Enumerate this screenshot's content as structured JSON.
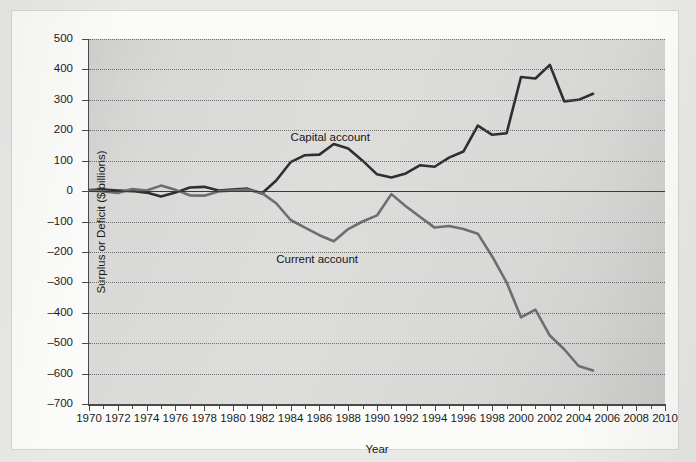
{
  "figure": {
    "background_color": "#e9e9e8",
    "plot_background_color": "#d8d8d6",
    "page_color": "#fbfbfa"
  },
  "chart_data": {
    "type": "line",
    "title": "",
    "xlabel": "Year",
    "ylabel": "Surplus or Deficit ($ billions)",
    "xlim": [
      1970,
      2010
    ],
    "ylim": [
      -700,
      500
    ],
    "ytick_step": 100,
    "xtick_step": 2,
    "x_minor_tick_step": 1,
    "grid": "horizontal dotted gridlines at every 100; solid line at 0",
    "legend": "inline labels placed next to each series",
    "yticks": [
      500,
      400,
      300,
      200,
      100,
      0,
      -100,
      -200,
      -300,
      -400,
      -500,
      -600,
      -700
    ],
    "ytick_labels": [
      "500",
      "400",
      "300",
      "200",
      "100",
      "0",
      "-100",
      "-200",
      "-300",
      "-400",
      "-500",
      "-600",
      "-700"
    ],
    "xticks": [
      1970,
      1972,
      1974,
      1976,
      1978,
      1980,
      1982,
      1984,
      1986,
      1988,
      1990,
      1992,
      1994,
      1996,
      1998,
      2000,
      2002,
      2004,
      2006,
      2008,
      2010
    ],
    "xtick_labels": [
      "1970",
      "1972",
      "1974",
      "1976",
      "1978",
      "1980",
      "1982",
      "1984",
      "1986",
      "1988",
      "1990",
      "1992",
      "1994",
      "1996",
      "1998",
      "2000",
      "2002",
      "2004",
      "2006",
      "2008",
      "2010"
    ],
    "x": [
      1970,
      1971,
      1972,
      1973,
      1974,
      1975,
      1976,
      1977,
      1978,
      1979,
      1980,
      1981,
      1982,
      1983,
      1984,
      1985,
      1986,
      1987,
      1988,
      1989,
      1990,
      1991,
      1992,
      1993,
      1994,
      1995,
      1996,
      1997,
      1998,
      1999,
      2000,
      2001,
      2002,
      2003,
      2004,
      2005
    ],
    "series": [
      {
        "name": "Capital account",
        "color": "#2f2f2f",
        "label_x": 1984,
        "label_y": 175,
        "values": [
          3,
          5,
          2,
          0,
          -5,
          -18,
          -5,
          12,
          14,
          2,
          5,
          8,
          -8,
          35,
          95,
          118,
          120,
          155,
          140,
          100,
          55,
          45,
          58,
          85,
          80,
          110,
          130,
          215,
          185,
          190,
          375,
          370,
          415,
          295,
          300,
          320
        ]
      },
      {
        "name": "Current account",
        "color": "#6e6e6e",
        "label_x": 1983,
        "label_y": -225,
        "values": [
          2,
          -1,
          -6,
          7,
          2,
          18,
          4,
          -14,
          -15,
          -1,
          2,
          5,
          -6,
          -40,
          -95,
          -120,
          -145,
          -165,
          -125,
          -100,
          -80,
          -10,
          -50,
          -85,
          -120,
          -115,
          -125,
          -140,
          -215,
          -300,
          -415,
          -390,
          -475,
          -520,
          -575,
          -590
        ]
      }
    ]
  }
}
